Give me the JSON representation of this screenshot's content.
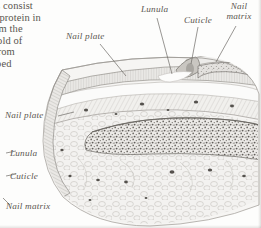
{
  "figure": {
    "type": "anatomical-cross-section",
    "style": "grayscale engraving / stipple halftone",
    "colors": {
      "background": "#fdfdfc",
      "ink": "#5b5650",
      "tissue_light": "#efeeec",
      "tissue_mid": "#d9d7d3",
      "tissue_dark": "#a9a6a1",
      "bone_stipple": "#6f6c67",
      "nail_plate": "#e8e7e4"
    }
  },
  "body_text": {
    "lines": [
      "oes consist",
      "gh protein in",
      "from the",
      "a fold of",
      "d from",
      "haped"
    ]
  },
  "callouts": {
    "top": [
      {
        "label": "Nail plate",
        "name": "nail-plate"
      },
      {
        "label": "Lunula",
        "name": "lunula"
      },
      {
        "label": "Cuticle",
        "name": "cuticle"
      },
      {
        "label": "Nail matrix",
        "name": "nail-matrix"
      }
    ],
    "left": [
      {
        "label": "Nail plate",
        "name": "nail-plate"
      },
      {
        "label": "Lunula",
        "name": "lunula"
      },
      {
        "label": "Cuticle",
        "name": "cuticle"
      },
      {
        "label": "Nail matrix",
        "name": "nail-matrix"
      }
    ]
  },
  "labels": {
    "nail_plate_top": "Nail plate",
    "lunula_top": "Lunula",
    "cuticle_top": "Cuticle",
    "nail_matrix_top": "Nail matrix",
    "nail_plate_left": "Nail plate",
    "lunula_left": "Lunula",
    "cuticle_left": "Cuticle",
    "nail_matrix_left": "Nail matrix"
  }
}
